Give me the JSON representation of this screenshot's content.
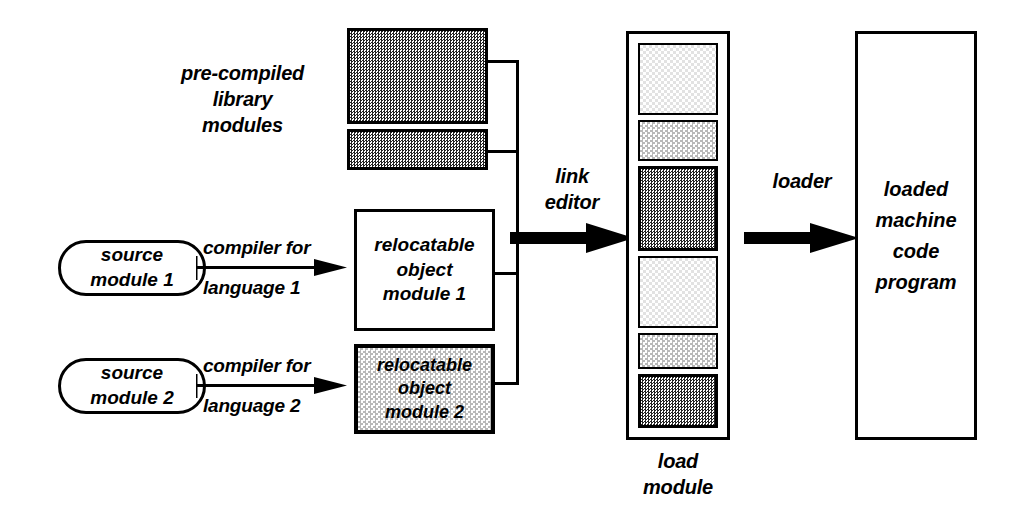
{
  "diagram": {
    "background_color": "#ffffff",
    "stroke_color": "#000000"
  },
  "labels": {
    "precompiled_library": "pre-compiled\nlibrary\nmodules",
    "link_editor": "link\neditor",
    "loader": "loader",
    "load_module": "load\nmodule"
  },
  "sources": [
    {
      "name": "source-module-1",
      "text": "source\nmodule 1"
    },
    {
      "name": "source-module-2",
      "text": "source\nmodule 2"
    }
  ],
  "compilers": [
    {
      "name": "compiler-1",
      "top_text": "compiler for",
      "bottom_text": "language 1"
    },
    {
      "name": "compiler-2",
      "top_text": "compiler for",
      "bottom_text": "language 2"
    }
  ],
  "object_modules": [
    {
      "name": "relocatable-object-module-1",
      "text": "relocatable\nobject\nmodule 1",
      "fill": "white"
    },
    {
      "name": "relocatable-object-module-2",
      "text": "relocatable\nobject\nmodule 2",
      "fill": "light-gray-dither"
    }
  ],
  "library_modules": [
    {
      "name": "library-module-1",
      "fill": "dark-dither"
    },
    {
      "name": "library-module-2",
      "fill": "dark-dither"
    }
  ],
  "load_module_segments": [
    {
      "name": "load-segment-1",
      "fill": "very-light-dither"
    },
    {
      "name": "load-segment-2",
      "fill": "light-gray-dither"
    },
    {
      "name": "load-segment-3",
      "fill": "dark-dither"
    },
    {
      "name": "load-segment-4",
      "fill": "very-light-dither"
    },
    {
      "name": "load-segment-5",
      "fill": "light-gray-dither"
    },
    {
      "name": "load-segment-6",
      "fill": "dark-dither"
    }
  ],
  "output": {
    "name": "loaded-machine-code-program",
    "text": "loaded\nmachine\ncode\nprogram"
  },
  "colors": {
    "ink": "#000000",
    "paper": "#ffffff",
    "dark_dither": "#232323",
    "gray_dither": "#7b7b7b",
    "light_dither": "#b9b9b9",
    "very_light_dither": "#e2e2e2"
  }
}
